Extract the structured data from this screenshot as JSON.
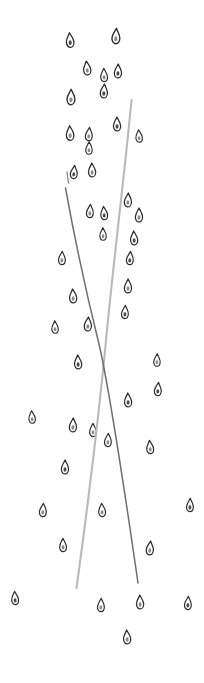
{
  "scene": {
    "title": "Rain sketch",
    "description": "Hand-drawn sketch of falling raindrops with two crossing trajectory lines",
    "width": 204,
    "height": 683,
    "background_color": "#ffffff"
  },
  "palette": {
    "drop_stroke": "#2b2b2b",
    "light_line": "#b9b9b9",
    "dark_line": "#6f6f6f",
    "stray_mark": "#8a8a8a"
  },
  "lines": [
    {
      "name": "light-trajectory",
      "color": "#b9b9b9",
      "width": 2.1,
      "path": "M 131.5 100 C 126 160, 115 250, 108 320 C 101 395, 90 490, 76.5 588",
      "start": [
        131.5,
        100
      ],
      "end": [
        76.5,
        588
      ],
      "direction": "down-left"
    },
    {
      "name": "dark-trajectory",
      "color": "#6f6f6f",
      "width": 1.5,
      "path": "M 65.5 188 C 74 235, 88 300, 99 344 C 110 392, 126 500, 138 583",
      "start": [
        65.5,
        188
      ],
      "end": [
        138,
        583
      ],
      "direction": "down-right"
    }
  ],
  "crossing_point": [
    101,
    345
  ],
  "stray_mark": {
    "name": "stray-tick",
    "path": "M 67 172 L 68.5 183",
    "color": "#8a8a8a",
    "width": 1.3
  },
  "drops": [
    {
      "x": 70,
      "y": 40,
      "s": 1.05,
      "r": -4
    },
    {
      "x": 116,
      "y": 36,
      "s": 1.1,
      "r": 3
    },
    {
      "x": 87,
      "y": 68,
      "s": 1.0,
      "r": -6
    },
    {
      "x": 118,
      "y": 71,
      "s": 1.0,
      "r": 2
    },
    {
      "x": 104,
      "y": 75,
      "s": 0.95,
      "r": -2
    },
    {
      "x": 71,
      "y": 97,
      "s": 1.1,
      "r": 1
    },
    {
      "x": 104,
      "y": 91,
      "s": 1.0,
      "r": 4
    },
    {
      "x": 70,
      "y": 133,
      "s": 1.05,
      "r": -3
    },
    {
      "x": 89,
      "y": 134,
      "s": 0.95,
      "r": 5
    },
    {
      "x": 117,
      "y": 124,
      "s": 1.0,
      "r": -1
    },
    {
      "x": 89,
      "y": 148,
      "s": 0.9,
      "r": 2
    },
    {
      "x": 139,
      "y": 136,
      "s": 0.9,
      "r": -4
    },
    {
      "x": 74,
      "y": 172,
      "s": 0.95,
      "r": 6
    },
    {
      "x": 92,
      "y": 170,
      "s": 1.0,
      "r": -2
    },
    {
      "x": 128,
      "y": 200,
      "s": 1.0,
      "r": 3
    },
    {
      "x": 104,
      "y": 213,
      "s": 0.95,
      "r": -5
    },
    {
      "x": 139,
      "y": 215,
      "s": 1.0,
      "r": 1
    },
    {
      "x": 90,
      "y": 211,
      "s": 0.95,
      "r": 4
    },
    {
      "x": 134,
      "y": 238,
      "s": 1.0,
      "r": -3
    },
    {
      "x": 62,
      "y": 258,
      "s": 0.95,
      "r": 2
    },
    {
      "x": 103,
      "y": 234,
      "s": 0.9,
      "r": -1
    },
    {
      "x": 130,
      "y": 258,
      "s": 0.95,
      "r": 5
    },
    {
      "x": 73,
      "y": 296,
      "s": 1.0,
      "r": -4
    },
    {
      "x": 128,
      "y": 286,
      "s": 1.0,
      "r": 1
    },
    {
      "x": 125,
      "y": 312,
      "s": 0.95,
      "r": 3
    },
    {
      "x": 55,
      "y": 327,
      "s": 0.9,
      "r": -2
    },
    {
      "x": 88,
      "y": 324,
      "s": 1.0,
      "r": 4
    },
    {
      "x": 78,
      "y": 362,
      "s": 1.0,
      "r": -3
    },
    {
      "x": 157,
      "y": 360,
      "s": 0.9,
      "r": 2
    },
    {
      "x": 93,
      "y": 430,
      "s": 0.95,
      "r": -1
    },
    {
      "x": 158,
      "y": 389,
      "s": 0.95,
      "r": 5
    },
    {
      "x": 32,
      "y": 417,
      "s": 0.9,
      "r": -4
    },
    {
      "x": 73,
      "y": 425,
      "s": 1.0,
      "r": 2
    },
    {
      "x": 128,
      "y": 400,
      "s": 1.0,
      "r": -2
    },
    {
      "x": 108,
      "y": 440,
      "s": 0.95,
      "r": 3
    },
    {
      "x": 150,
      "y": 447,
      "s": 0.95,
      "r": -5
    },
    {
      "x": 65,
      "y": 467,
      "s": 1.0,
      "r": 1
    },
    {
      "x": 43,
      "y": 510,
      "s": 0.95,
      "r": 4
    },
    {
      "x": 102,
      "y": 510,
      "s": 0.95,
      "r": -3
    },
    {
      "x": 190,
      "y": 505,
      "s": 0.95,
      "r": 2
    },
    {
      "x": 63,
      "y": 545,
      "s": 0.95,
      "r": -1
    },
    {
      "x": 150,
      "y": 548,
      "s": 1.0,
      "r": 5
    },
    {
      "x": 15,
      "y": 598,
      "s": 0.95,
      "r": -4
    },
    {
      "x": 101,
      "y": 605,
      "s": 0.95,
      "r": 2
    },
    {
      "x": 140,
      "y": 602,
      "s": 1.0,
      "r": -2
    },
    {
      "x": 188,
      "y": 603,
      "s": 0.95,
      "r": 3
    },
    {
      "x": 127,
      "y": 637,
      "s": 1.0,
      "r": -3
    }
  ]
}
